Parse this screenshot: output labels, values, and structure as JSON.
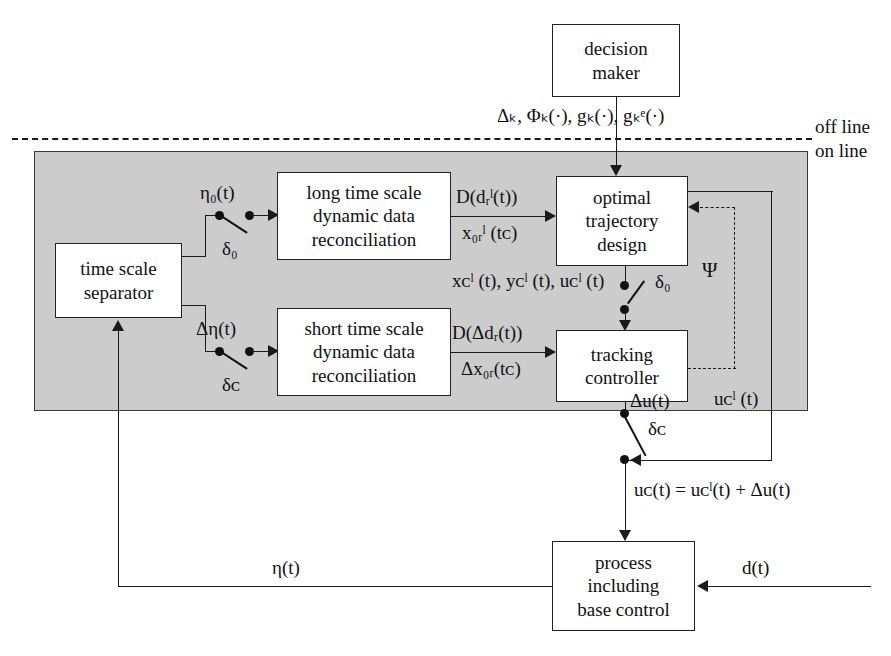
{
  "diagram": {
    "partition_labels": {
      "off_line": "off line",
      "on_line": "on line"
    },
    "blocks": {
      "decision_maker": {
        "line1": "decision",
        "line2": "maker"
      },
      "long_ddr": {
        "line1": "long time scale",
        "line2": "dynamic data",
        "line3": "reconciliation"
      },
      "short_ddr": {
        "line1": "short time scale",
        "line2": "dynamic data",
        "line3": "reconciliation"
      },
      "time_scale_separator": {
        "line1": "time scale",
        "line2": "separator"
      },
      "optimal_trajectory_design": {
        "line1": "optimal",
        "line2": "trajectory",
        "line3": "design"
      },
      "tracking_controller": {
        "line1": "tracking",
        "line2": "controller"
      },
      "process": {
        "line1": "process",
        "line2": "including",
        "line3": "base control"
      }
    },
    "signals": {
      "decision_outputs": "Δₖ, Φₖ(·), gₖ(·), gₖᵉ(·)",
      "eta0": "η₀(t)",
      "delta0_top": "δ₀",
      "delta0_mid": "δ₀",
      "delta_eta": "Δη(t)",
      "delta_c_left": "δᴄ",
      "delta_c_right": "δᴄ",
      "long_ddr_out_top": "D(dᵣˡ(t))",
      "long_ddr_out_bottom": "x₀ᵣˡ (tᴄ)",
      "short_ddr_out_top": "D(Δdᵣ(t))",
      "short_ddr_out_bottom": "Δx₀ᵣ(tᴄ)",
      "traj_state_outputs": "xᴄˡ (t), yᴄˡ (t), uᴄˡ (t)",
      "psi": "Ψ",
      "delta_u": "Δu(t)",
      "uc_l": "uᴄˡ (t)",
      "sum_equation": "uᴄ(t) = uᴄˡ(t) + Δu(t)",
      "disturbance": "d(t)",
      "measurement": "η(t)"
    },
    "colors": {
      "online_fill": "#cccccc",
      "stroke": "#1a1a1a",
      "block_fill": "#ffffff",
      "page_bg": "#ffffff"
    }
  }
}
